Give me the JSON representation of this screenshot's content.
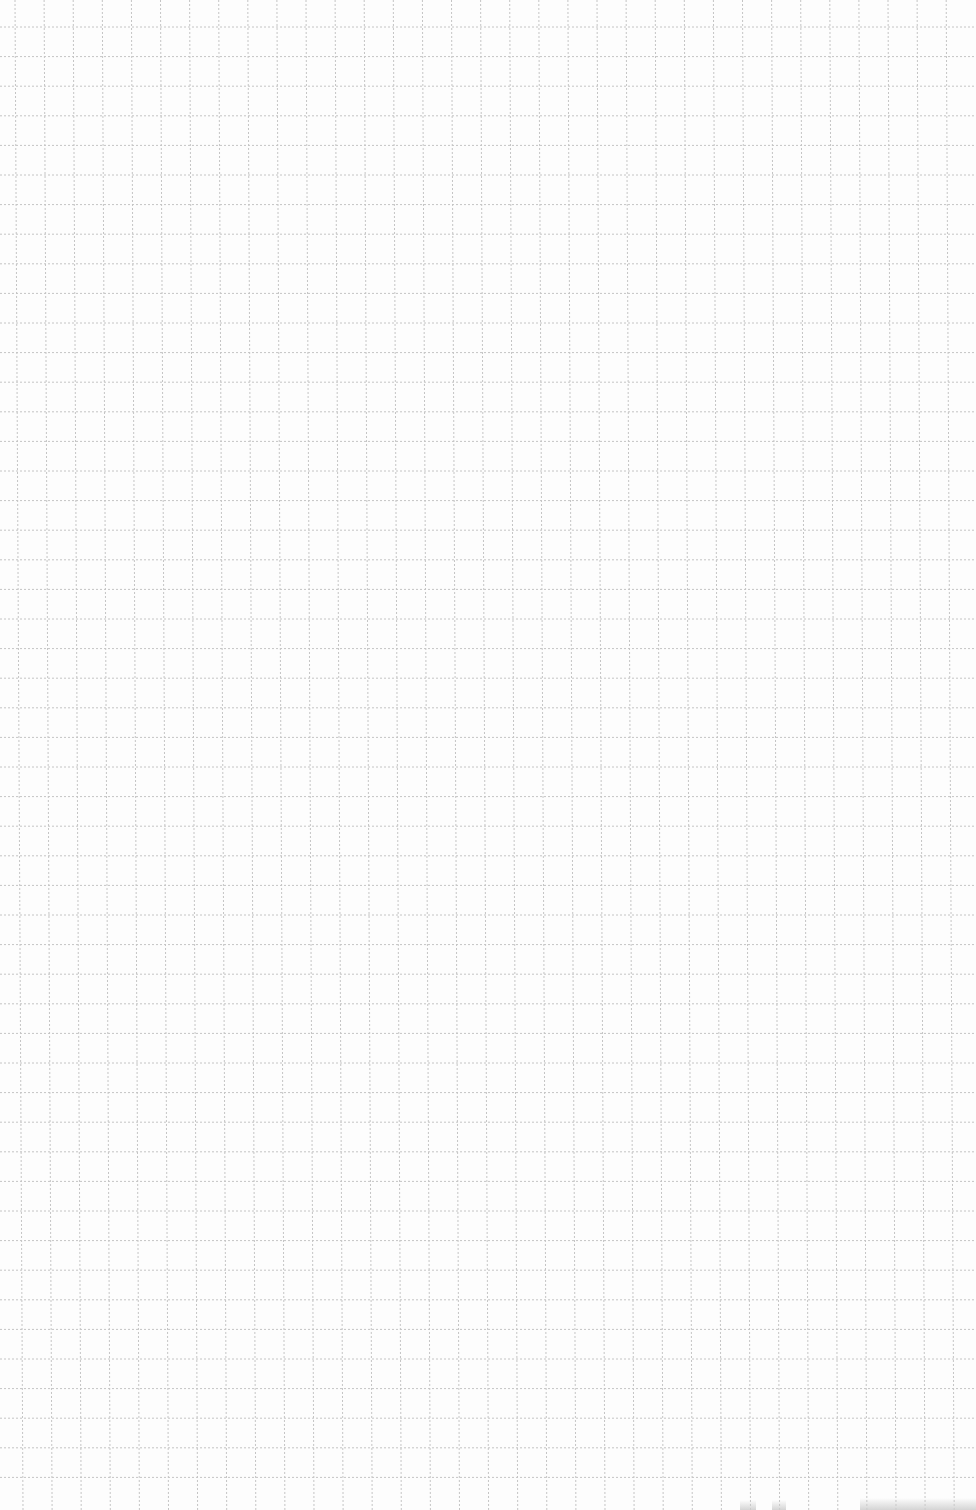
{
  "page": {
    "type": "graph-paper-sheet",
    "width": 976,
    "height": 1510,
    "background_color": "#fdfdfd"
  },
  "grid": {
    "line_color": "#c4c4c4",
    "line_style": "dotted",
    "line_width": 1,
    "vertical": {
      "first_x": 15,
      "spacing": 29.1,
      "count": 33,
      "skew_bottom_offset": 8
    },
    "horizontal": {
      "first_y": 27,
      "spacing": 29.6,
      "count": 50
    }
  },
  "scan_artifacts": [
    {
      "x": 740,
      "y": 1500,
      "width": 16,
      "height": 10
    },
    {
      "x": 772,
      "y": 1500,
      "width": 14,
      "height": 10
    },
    {
      "x": 860,
      "y": 1498,
      "width": 116,
      "height": 12
    }
  ]
}
